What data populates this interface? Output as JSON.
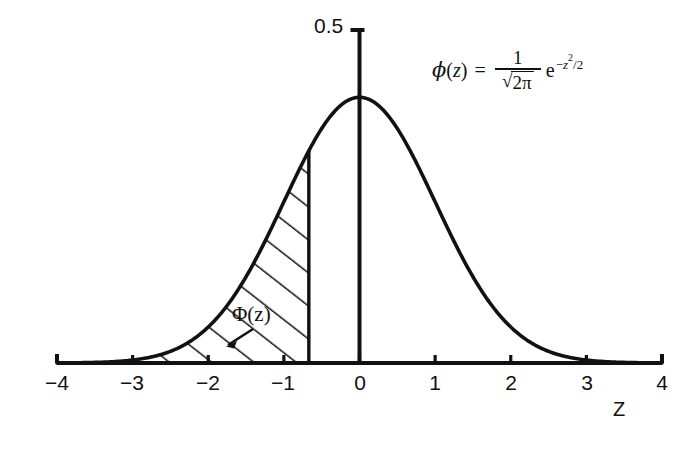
{
  "figure": {
    "title": "",
    "background_color": "#ffffff",
    "ink_color": "#111111"
  },
  "axes": {
    "x_axis_name": "Z",
    "x_tick_labels": [
      "−4",
      "−3",
      "−2",
      "−1",
      "0",
      "1",
      "2",
      "3",
      "4"
    ],
    "y_top_label": "0.5"
  },
  "annotations": {
    "region_label": "Φ(z)",
    "formula": {
      "lhs_fn": "ϕ",
      "lhs_arg_open": "(",
      "lhs_arg": "z",
      "lhs_arg_close": ")",
      "equals": "=",
      "numerator": "1",
      "radical": "√",
      "radicand": "2π",
      "exp_base": "e",
      "exp_sign": "−",
      "exp_var": "z",
      "exp_power": "2",
      "exp_div": "/2",
      "plain": "ϕ(z) = 1/√(2π) e^(−z²/2)"
    }
  },
  "chart_data": {
    "type": "line",
    "title": "",
    "xlabel": "Z",
    "ylabel": "",
    "xlim": [
      -4,
      4
    ],
    "ylim": [
      0,
      0.5
    ],
    "grid": false,
    "legend": null,
    "curve_name": "standard normal probability density ϕ(z)",
    "shaded_region": {
      "name": "Φ(z)",
      "from": -4,
      "to": -0.67,
      "hatch": "diagonal-lines-45deg",
      "area_value": 0.25
    },
    "x": [
      -4,
      -3.75,
      -3.5,
      -3.25,
      -3,
      -2.75,
      -2.5,
      -2.25,
      -2,
      -1.75,
      -1.5,
      -1.25,
      -1,
      -0.75,
      -0.67,
      -0.5,
      -0.25,
      0,
      0.25,
      0.5,
      0.75,
      1,
      1.25,
      1.5,
      1.75,
      2,
      2.25,
      2.5,
      2.75,
      3,
      3.25,
      3.5,
      3.75,
      4
    ],
    "y": [
      0.0001,
      0.0004,
      0.0009,
      0.002,
      0.0044,
      0.0091,
      0.0175,
      0.0317,
      0.054,
      0.0863,
      0.1295,
      0.1826,
      0.242,
      0.3011,
      0.3187,
      0.3521,
      0.3867,
      0.3989,
      0.3867,
      0.3521,
      0.3011,
      0.242,
      0.1826,
      0.1295,
      0.0863,
      0.054,
      0.0317,
      0.0175,
      0.0091,
      0.0044,
      0.002,
      0.0009,
      0.0004,
      0.0001
    ],
    "x_ticks": [
      -4,
      -3,
      -2,
      -1,
      0,
      1,
      2,
      3,
      4
    ],
    "y_ticks": [
      0.5
    ]
  }
}
